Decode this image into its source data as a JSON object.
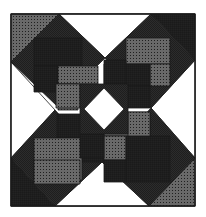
{
  "canvas": {
    "width": 206,
    "height": 217
  },
  "colors": {
    "background": "#ffffff",
    "outline": "#1a1a1a",
    "dark": "#222222",
    "medium_checker_fg": "#3a3a3a",
    "light_dot_fg": "#444444",
    "white": "#ffffff"
  },
  "fills": {
    "white": "White",
    "dark": "Dark crosshatch",
    "checker": "Medium checker",
    "dots": "Light dots",
    "darkdots": "Dark dots"
  },
  "frame": {
    "x": 11,
    "y": 14,
    "w": 184,
    "h": 192
  },
  "shapes": [
    {
      "name": "corner-triangle-top-left",
      "fill": "dots",
      "points": "11,14 59,14 11,62"
    },
    {
      "name": "corner-triangle-top-right",
      "fill": "dark",
      "points": "151,14 195,14 195,60"
    },
    {
      "name": "corner-triangle-bottom-left",
      "fill": "dark",
      "points": "11,158 11,206 55,206"
    },
    {
      "name": "corner-triangle-bottom-right",
      "fill": "dots",
      "points": "195,158 195,206 149,206"
    },
    {
      "name": "edge-triangle-top",
      "fill": "white",
      "points": "59,14 151,14 105,58"
    },
    {
      "name": "edge-triangle-left",
      "fill": "white",
      "points": "11,62 11,158 55,110"
    },
    {
      "name": "edge-triangle-right",
      "fill": "white",
      "points": "195,60 195,158 151,108"
    },
    {
      "name": "edge-triangle-bottom",
      "fill": "white",
      "points": "55,206 149,206 102,162"
    },
    {
      "name": "diamond-top-left",
      "fill": "checker",
      "points": "59,14 105,58 57,106 11,62"
    },
    {
      "name": "diamond-top-right",
      "fill": "checker",
      "points": "151,14 195,60 151,108 105,58"
    },
    {
      "name": "diamond-bottom-left",
      "fill": "checker",
      "points": "55,110 102,162 55,206 11,158"
    },
    {
      "name": "diamond-bottom-right",
      "fill": "checker",
      "points": "151,108 195,158 149,206 102,162"
    },
    {
      "name": "tl-dark-bar-top",
      "fill": "dark",
      "points": "34,38 82,38 82,66 34,66"
    },
    {
      "name": "tl-dark-bar-left",
      "fill": "dark",
      "points": "34,66 58,66 58,92 34,92"
    },
    {
      "name": "tl-dot-bar",
      "fill": "dots",
      "points": "58,66 98,66 98,84 58,84"
    },
    {
      "name": "tl-dot-stem",
      "fill": "dots",
      "points": "58,84 78,84 78,110 58,110"
    },
    {
      "name": "tr-dot-bar-top",
      "fill": "dots",
      "points": "126,38 170,38 170,64 126,64"
    },
    {
      "name": "tr-dot-bar-right",
      "fill": "dots",
      "points": "150,64 170,64 170,86 150,86"
    },
    {
      "name": "tr-dark-bar",
      "fill": "dark",
      "points": "104,64 150,64 150,86 104,86"
    },
    {
      "name": "tr-dark-stem",
      "fill": "dark",
      "points": "126,86 150,86 150,108 126,108"
    },
    {
      "name": "bl-dark-bar-top",
      "fill": "dark",
      "points": "57,114 104,114 104,138 57,138"
    },
    {
      "name": "bl-dark-stem",
      "fill": "dark",
      "points": "82,138 104,138 104,162 82,162"
    },
    {
      "name": "bl-dot-bar",
      "fill": "dots",
      "points": "34,138 82,138 82,180 34,180"
    },
    {
      "name": "bl-dot-base",
      "fill": "dots",
      "points": "34,160 80,160 80,184 34,184"
    },
    {
      "name": "br-dot-bar",
      "fill": "dots",
      "points": "104,112 150,112 150,136 104,136"
    },
    {
      "name": "br-dot-stem",
      "fill": "dots",
      "points": "104,136 126,136 126,160 104,160"
    },
    {
      "name": "br-dark-bar",
      "fill": "dark",
      "points": "126,136 170,136 170,182 126,182"
    },
    {
      "name": "br-dark-base",
      "fill": "dark",
      "points": "104,160 126,160 126,182 104,182"
    },
    {
      "name": "center-left-dot",
      "fill": "dots",
      "points": "56,84 80,84 80,108 56,108"
    },
    {
      "name": "center-right-dot",
      "fill": "dots",
      "points": "128,112 150,112 150,136 128,136"
    },
    {
      "name": "center-top-dark",
      "fill": "dark",
      "points": "104,60 126,60 126,84 104,84"
    },
    {
      "name": "center-bottom-dark",
      "fill": "dark",
      "points": "80,134 104,134 104,158 80,158"
    },
    {
      "name": "center-ring-checker",
      "fill": "checker",
      "points": "80,84 128,84 128,134 80,134"
    },
    {
      "name": "center-diamond",
      "fill": "white",
      "points": "104,88 124,109 104,130 84,109"
    }
  ]
}
